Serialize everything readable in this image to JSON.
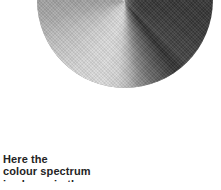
{
  "figure": {
    "name": "colour-spectrum-disc",
    "shape": "circle",
    "gradient_type": "conic",
    "palette": "grayscale",
    "background_color": "#ffffff",
    "bright_axis_color": "#fbfbfb",
    "dark_axis_color": "#363636",
    "mid_color": "#a2a2a2",
    "light_color": "#dcdcdc",
    "clipped_at_top": true
  },
  "caption": {
    "line1": "Here the",
    "line2": "colour spectrum",
    "line3": "is shown in the",
    "text_color": "#242424"
  }
}
